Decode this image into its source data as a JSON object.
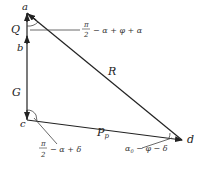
{
  "diagram": {
    "type": "force-triangle",
    "colors": {
      "line": "#222222",
      "text": "#222222",
      "background": "#ffffff"
    },
    "points": {
      "a": {
        "label": "a",
        "x": 27,
        "y": 13
      },
      "c": {
        "label": "c",
        "x": 27,
        "y": 120
      },
      "d": {
        "label": "d",
        "x": 182,
        "y": 140
      }
    },
    "segments": {
      "Q": {
        "label": "Q"
      },
      "b": {
        "label": "b"
      },
      "G": {
        "label": "G"
      },
      "R": {
        "label": "R"
      },
      "Pp": {
        "label": "P",
        "subscript": "p"
      }
    },
    "angles": {
      "at_a": {
        "numerator": "π",
        "denominator": "2",
        "rest": "− α + φ + α"
      },
      "at_c": {
        "numerator": "π",
        "denominator": "2",
        "rest": "− α + δ"
      },
      "at_d": {
        "base": "α",
        "subscript": "0",
        "rest": " − φ − δ"
      }
    }
  }
}
